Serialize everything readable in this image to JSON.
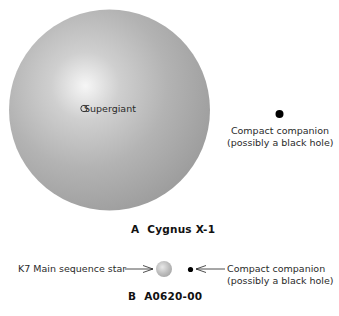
{
  "panel_a": {
    "letter": "A",
    "title": "Cygnus X-1",
    "star_label": "O Supergiant",
    "star_marker": "open-circle-icon",
    "companion_label_line1": "Compact companion",
    "companion_label_line2": "(possibly a black hole)"
  },
  "panel_b": {
    "letter": "B",
    "title": "A0620-00",
    "star_label": "K7 Main sequence star",
    "companion_label_line1": "Compact companion",
    "companion_label_line2": "(possibly a black hole)"
  },
  "colors": {
    "supergiant_highlight": "#f4f4f4",
    "supergiant_mid": "#b8b8b8",
    "supergiant_edge": "#9a9a9a",
    "companion": "#000000",
    "k7_highlight": "#e6e6e6",
    "k7_edge": "#a8a8a8"
  }
}
